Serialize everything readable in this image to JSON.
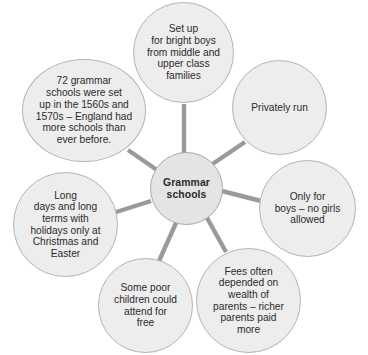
{
  "diagram": {
    "type": "mind-map",
    "title": "Grammar schools",
    "center": {
      "id": "center",
      "label": "Grammar\nschools",
      "bold": true
    },
    "colors": {
      "node_fill": "#ededed",
      "node_border": "#b4b4b4",
      "center_fill": "#e4e4e4",
      "spoke": "#9a9a9a",
      "text": "#2b2b2b",
      "background": "#ffffff"
    },
    "branches": [
      {
        "id": "top",
        "label": "Set up\nfor bright boys\nfrom middle and\nupper class\nfamilies",
        "position": "top"
      },
      {
        "id": "top-right",
        "label": "Privately run",
        "position": "top-right"
      },
      {
        "id": "right",
        "label": "Only for\nboys – no girls\nallowed",
        "position": "right"
      },
      {
        "id": "bottom-right",
        "label": "Fees often\ndepended on\nwealth of\nparents – richer\nparents paid\nmore",
        "position": "bottom-right"
      },
      {
        "id": "bottom",
        "label": "Some poor\nchildren could\nattend for\nfree",
        "position": "bottom"
      },
      {
        "id": "left",
        "label": "Long\ndays and long\nterms with\nholidays only at\nChristmas and\nEaster",
        "position": "left"
      },
      {
        "id": "top-left",
        "label": "72 grammar\nschools were set\nup in the 1560s and\n1570s – England had\nmore schools than\never before.",
        "position": "top-left"
      }
    ]
  }
}
